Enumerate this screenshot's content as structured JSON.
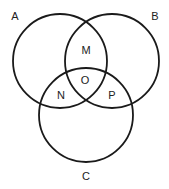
{
  "diagram": {
    "type": "venn",
    "sets": [
      {
        "id": "A",
        "label": "A"
      },
      {
        "id": "B",
        "label": "B"
      },
      {
        "id": "C",
        "label": "C"
      }
    ],
    "regions": [
      {
        "id": "M",
        "label": "M",
        "sets": [
          "A",
          "B"
        ]
      },
      {
        "id": "O",
        "label": "O",
        "sets": [
          "A",
          "B",
          "C"
        ]
      },
      {
        "id": "N",
        "label": "N",
        "sets": [
          "A",
          "C"
        ]
      },
      {
        "id": "P",
        "label": "P",
        "sets": [
          "B",
          "C"
        ]
      }
    ],
    "stroke_color": "#1a1a1a",
    "background": "#ffffff"
  }
}
